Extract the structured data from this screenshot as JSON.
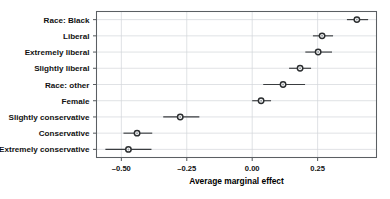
{
  "chart_data": {
    "type": "scatter",
    "title": "",
    "subtitle": "",
    "xlabel": "Average marginal effect",
    "ylabel": "",
    "xlim": [
      -0.595,
      0.475
    ],
    "ylim": [
      0,
      9
    ],
    "grid": "vertical",
    "legend": "none",
    "orientation": "horizontal",
    "marker": "open-circle",
    "error_bars": "horizontal 95% confidence interval",
    "xticks": [
      -0.5,
      -0.25,
      0.0,
      0.25
    ],
    "xticklabels": [
      "-0.50",
      "-0.25",
      "0.00",
      "0.25"
    ],
    "categories": [
      "Race: Black",
      "Liberal",
      "Extremely liberal",
      "Slightly liberal",
      "Race: other",
      "Female",
      "Slightly conservative",
      "Conservative",
      "Extremely conservative"
    ],
    "values": [
      0.4,
      0.267,
      0.252,
      0.183,
      0.118,
      0.034,
      -0.275,
      -0.44,
      -0.473
    ],
    "ci_low": [
      0.362,
      0.232,
      0.203,
      0.141,
      0.042,
      0.0,
      -0.34,
      -0.492,
      -0.561
    ],
    "ci_high": [
      0.443,
      0.309,
      0.305,
      0.225,
      0.202,
      0.072,
      -0.202,
      -0.382,
      -0.385
    ],
    "points": [
      {
        "label": "Race: Black",
        "value": 0.4,
        "ci_low": 0.362,
        "ci_high": 0.443
      },
      {
        "label": "Liberal",
        "value": 0.267,
        "ci_low": 0.232,
        "ci_high": 0.309
      },
      {
        "label": "Extremely liberal",
        "value": 0.252,
        "ci_low": 0.203,
        "ci_high": 0.305
      },
      {
        "label": "Slightly liberal",
        "value": 0.183,
        "ci_low": 0.141,
        "ci_high": 0.225
      },
      {
        "label": "Race: other",
        "value": 0.118,
        "ci_low": 0.042,
        "ci_high": 0.202
      },
      {
        "label": "Female",
        "value": 0.034,
        "ci_low": 0.0,
        "ci_high": 0.072
      },
      {
        "label": "Slightly conservative",
        "value": -0.275,
        "ci_low": -0.34,
        "ci_high": -0.202
      },
      {
        "label": "Conservative",
        "value": -0.44,
        "ci_low": -0.492,
        "ci_high": -0.382
      },
      {
        "label": "Extremely conservative",
        "value": -0.473,
        "ci_low": -0.561,
        "ci_high": -0.385
      }
    ],
    "colors": {
      "marker_edge": "#2b2e30",
      "marker_fill": "#ffffff",
      "marker_core": "#9aa0a6",
      "error_bar": "#3a3d40",
      "gridline": "#d2d6da",
      "frame": "#5b5f63",
      "text": "#111111",
      "background": "#ffffff"
    }
  }
}
